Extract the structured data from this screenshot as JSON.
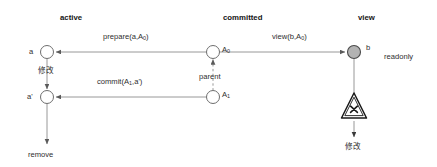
{
  "diagram": {
    "columns": [
      {
        "label": "active",
        "x": 60
      },
      {
        "label": "committed",
        "x": 223
      },
      {
        "label": "view",
        "x": 358
      }
    ],
    "nodes": [
      {
        "id": "a",
        "label": "a",
        "label_side": "left",
        "cx": 47,
        "cy": 52,
        "r": 6.5,
        "fill": "#ffffff",
        "stroke": "#6e6e6e"
      },
      {
        "id": "a2",
        "label": "a'",
        "label_side": "left",
        "cx": 47,
        "cy": 97,
        "r": 6.5,
        "fill": "#ffffff",
        "stroke": "#6e6e6e"
      },
      {
        "id": "A0",
        "label": "A",
        "sub": "0",
        "label_side": "right",
        "cx": 213,
        "cy": 52,
        "r": 6.5,
        "fill": "#ffffff",
        "stroke": "#6e6e6e"
      },
      {
        "id": "A1",
        "label": "A",
        "sub": "1",
        "label_side": "right",
        "cx": 213,
        "cy": 97,
        "r": 6.5,
        "fill": "#ffffff",
        "stroke": "#6e6e6e"
      },
      {
        "id": "b",
        "label": "b",
        "label_side": "right",
        "cx": 354,
        "cy": 52,
        "r": 6.5,
        "fill": "#b3b3b3",
        "stroke": "#4a4a4a"
      }
    ],
    "edges": [
      {
        "id": "prepare",
        "label": "prepare(a,A",
        "sub": "0",
        "label_tail": ")",
        "label_x": 103,
        "label_y": 37,
        "style": "solid"
      },
      {
        "id": "view",
        "label": "view(b,A",
        "sub": "0",
        "label_tail": ")",
        "label_x": 272,
        "label_y": 37,
        "style": "solid"
      },
      {
        "id": "commit",
        "label": "commit(A",
        "sub": "1",
        "label_tail": ",a')",
        "label_x": 97,
        "label_y": 82,
        "style": "solid"
      },
      {
        "id": "parent",
        "label": "parent",
        "label_x": 199,
        "label_y": 77,
        "style": "dashed"
      },
      {
        "id": "modify-left",
        "label": "修改",
        "label_x": 38,
        "label_y": 71,
        "style": "solid",
        "cjk": true
      },
      {
        "id": "modify-view",
        "label": "修改",
        "label_x": 345,
        "label_y": 147,
        "style": "solid",
        "cjk": true
      },
      {
        "id": "remove",
        "label": "remove",
        "label_x": 28,
        "label_y": 155,
        "style": "solid"
      }
    ],
    "annotations": [
      {
        "id": "readonly",
        "label": "readonly",
        "x": 384,
        "y": 57
      }
    ],
    "icons": [
      {
        "id": "forbidden-triangle",
        "name": "warning-triangle-x-icon",
        "cx": 354,
        "cy": 108
      }
    ],
    "colors": {
      "line": "#8d8d8d",
      "node_stroke": "#6e6e6e",
      "node_fill": "#ffffff",
      "view_node_fill": "#b3b3b3",
      "text": "#2e2e2e",
      "icon_stroke": "#1a1a1a"
    }
  }
}
